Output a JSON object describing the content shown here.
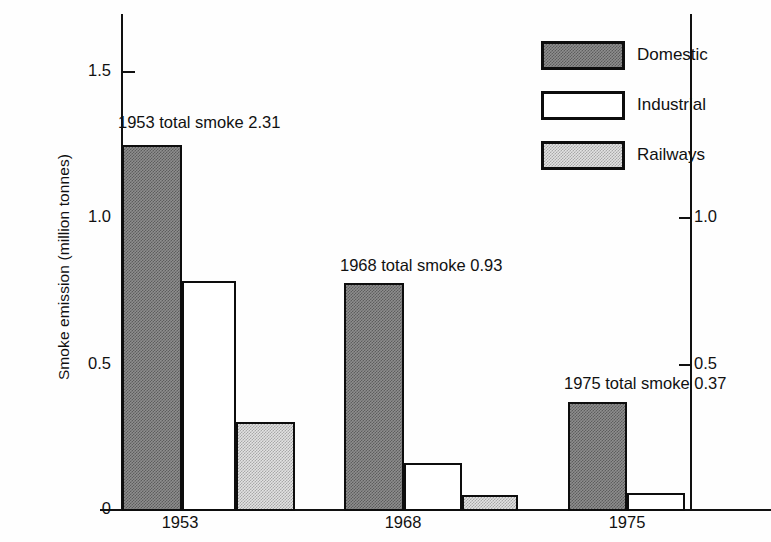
{
  "chart_data": {
    "type": "bar",
    "title": "",
    "subtitle": "",
    "xlabel": "",
    "ylabel": "Smoke emission (million tonnes)",
    "categories": [
      "1953",
      "1968",
      "1975"
    ],
    "series": [
      {
        "name": "Domestic",
        "values": [
          1.26,
          0.78,
          0.37
        ]
      },
      {
        "name": "Industrial",
        "values": [
          0.79,
          0.16,
          0.06
        ]
      },
      {
        "name": "Railways",
        "values": [
          0.31,
          0.05,
          0.0
        ]
      }
    ],
    "annotations": [
      "1953 total smoke 2.31",
      "1968 total smoke 0.93",
      "1975 total smoke 0.37"
    ],
    "left_axis": {
      "ticks": [
        0,
        0.5,
        1.0,
        1.5
      ],
      "tick_labels": [
        "0",
        "0.5",
        "1.0",
        "1.5"
      ],
      "ylim": [
        0,
        1.7
      ]
    },
    "right_axis": {
      "ticks": [
        0.5,
        1.0
      ],
      "tick_labels": [
        "0.5",
        "1.0"
      ]
    },
    "grid": false,
    "legend_position": "top-right",
    "colors": {
      "domestic": "#6e6e6e",
      "industrial": "#ffffff",
      "railways": "#d9d9d9",
      "outline": "#0d0d0d"
    }
  },
  "axis": {
    "ylabel": "Smoke emission (million tonnes)",
    "left_ticks": [
      {
        "label": "1.5",
        "y": 72
      },
      {
        "label": "1.0",
        "y": 218
      },
      {
        "label": "0.5",
        "y": 365
      },
      {
        "label": "0",
        "y": 510
      }
    ],
    "right_ticks": [
      {
        "label": "1.0",
        "y": 218
      },
      {
        "label": "0.5",
        "y": 365
      }
    ]
  },
  "groups": [
    {
      "xtick": "1953",
      "annotation": "1953 total smoke 2.31",
      "annotation_x": 118,
      "annotation_y": 113,
      "xtick_x": 180,
      "bars": [
        {
          "series": "Domestic",
          "value": "1.26",
          "x": 122,
          "w": 60,
          "h": 366
        },
        {
          "series": "Industrial",
          "value": "0.79",
          "x": 182,
          "w": 54,
          "h": 230
        },
        {
          "series": "Railways",
          "value": "0.31",
          "x": 236,
          "w": 59,
          "h": 89
        }
      ]
    },
    {
      "xtick": "1968",
      "annotation": "1968 total smoke 0.93",
      "annotation_x": 340,
      "annotation_y": 256,
      "xtick_x": 403,
      "bars": [
        {
          "series": "Domestic",
          "value": "0.78",
          "x": 344,
          "w": 60,
          "h": 228
        },
        {
          "series": "Industrial",
          "value": "0.16",
          "x": 404,
          "w": 58,
          "h": 48
        },
        {
          "series": "Railways",
          "value": "0.05",
          "x": 462,
          "w": 56,
          "h": 16
        }
      ]
    },
    {
      "xtick": "1975",
      "annotation": "1975 total smoke 0.37",
      "annotation_x": 564,
      "annotation_y": 374,
      "xtick_x": 627,
      "bars": [
        {
          "series": "Domestic",
          "value": "0.37",
          "x": 568,
          "w": 59,
          "h": 109
        },
        {
          "series": "Industrial",
          "value": "0.06",
          "x": 627,
          "w": 58,
          "h": 18
        }
      ]
    }
  ],
  "legend": {
    "items": [
      {
        "label": "Domestic",
        "fill": "fill-domestic",
        "swatch_name": "legend-swatch-domestic"
      },
      {
        "label": "Industrial",
        "fill": "fill-industrial",
        "swatch_name": "legend-swatch-industrial"
      },
      {
        "label": "Railways",
        "fill": "fill-railways",
        "swatch_name": "legend-swatch-railways"
      }
    ]
  }
}
